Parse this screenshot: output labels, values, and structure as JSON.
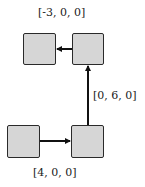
{
  "diagram": {
    "nodes": [
      {
        "id": "bottom-left",
        "x": 7,
        "y": 125,
        "w": 33,
        "h": 33
      },
      {
        "id": "bottom-right",
        "x": 71,
        "y": 125,
        "w": 33,
        "h": 33
      },
      {
        "id": "top-right",
        "x": 72,
        "y": 33,
        "w": 32,
        "h": 32
      },
      {
        "id": "top-left",
        "x": 23,
        "y": 33,
        "w": 33,
        "h": 32
      }
    ],
    "edges": [
      {
        "from": "bottom-left",
        "to": "bottom-right",
        "label": "[4, 0, 0]"
      },
      {
        "from": "bottom-right",
        "to": "top-right",
        "label": "[0, 6, 0]"
      },
      {
        "from": "top-right",
        "to": "top-left",
        "label": "[-3, 0, 0]"
      }
    ],
    "labels": {
      "top": "[-3, 0, 0]",
      "right": "[0, 6, 0]",
      "bottom": "[4, 0, 0]"
    },
    "colors": {
      "box_fill": "#d6d6d6",
      "stroke": "#2a2a2a"
    }
  }
}
